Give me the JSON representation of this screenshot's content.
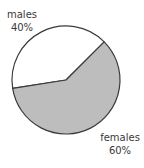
{
  "chart_data": {
    "type": "pie",
    "title": "",
    "categories": [
      "males",
      "females"
    ],
    "values": [
      40,
      60
    ],
    "unit": "%",
    "colors": [
      "#ffffff",
      "#bdbdbd"
    ],
    "edge_color": "#3a3a3a",
    "legend": "none",
    "labels": [
      {
        "name": "males",
        "value_text": "40%",
        "position": "top-left"
      },
      {
        "name": "females",
        "value_text": "60%",
        "position": "bottom-right"
      }
    ],
    "start_angle_deg": 45,
    "direction": "counterclockwise"
  }
}
